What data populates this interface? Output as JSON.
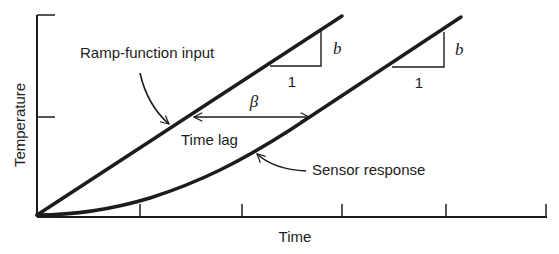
{
  "diagram": {
    "axes": {
      "x_label": "Time",
      "y_label": "Temperature"
    },
    "curves": [
      {
        "name": "Ramp-function input",
        "label": "Ramp-function input"
      },
      {
        "name": "Sensor response",
        "label": "Sensor response"
      }
    ],
    "annotations": {
      "time_lag_label": "Time lag",
      "lag_symbol": "β",
      "slope_symbol": "b",
      "slope_run": "1",
      "slope_symbol_2": "b",
      "slope_run_2": "1"
    },
    "colors": {
      "ink": "#1c1c1c",
      "background": "#ffffff"
    }
  }
}
